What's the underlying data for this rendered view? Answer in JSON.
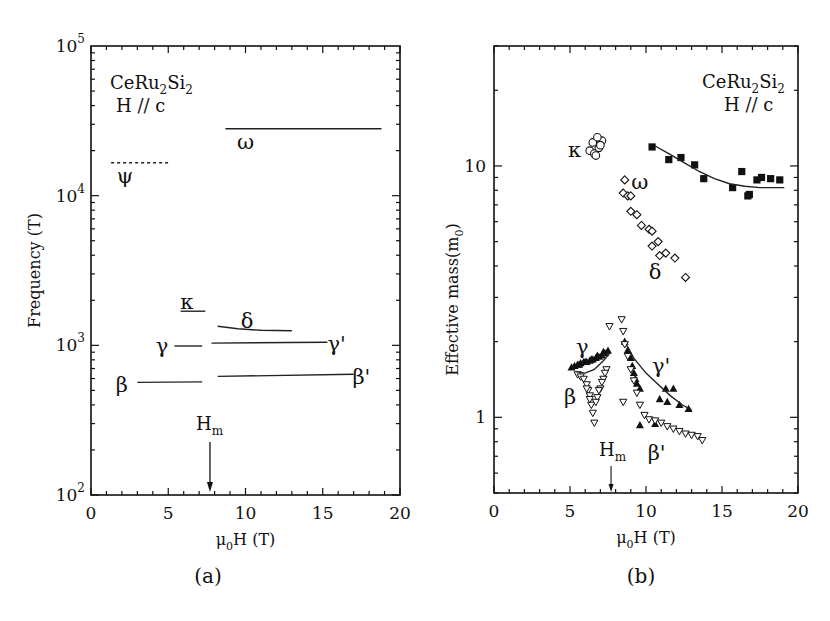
{
  "figure": {
    "panel_labels": [
      "(a)",
      "(b)"
    ]
  },
  "chart_data": [
    {
      "type": "line",
      "panel": "(a)",
      "title": "",
      "annotation": {
        "compound": "CeRu2Si2",
        "compound_parts": [
          "CeRu",
          "2",
          "Si",
          "2"
        ],
        "field_dir": "H // c"
      },
      "xlabel": "μ0H (T)",
      "xlabel_parts": [
        "μ",
        "0",
        "H (T)"
      ],
      "ylabel": "Frequency (T)",
      "xlim": [
        0,
        20
      ],
      "ylim": [
        100,
        100000
      ],
      "yscale": "log",
      "xticks": [
        0,
        5,
        10,
        15,
        20
      ],
      "yticks": [
        {
          "base": "10",
          "exp": "2",
          "value": 100
        },
        {
          "base": "10",
          "exp": "3",
          "value": 1000
        },
        {
          "base": "10",
          "exp": "4",
          "value": 10000
        },
        {
          "base": "10",
          "exp": "5",
          "value": 100000
        }
      ],
      "grid": false,
      "marker_annotation": {
        "label": "H",
        "sub": "m",
        "x": 7.7
      },
      "series": [
        {
          "name": "ω",
          "style": "solid",
          "x": [
            8.7,
            18.8
          ],
          "y": [
            28000,
            28000
          ],
          "label_pos": [
            10.0,
            23000
          ]
        },
        {
          "name": "ψ",
          "style": "dashed",
          "x": [
            1.3,
            5.0
          ],
          "y": [
            16600,
            16600
          ],
          "label_pos": [
            2.2,
            13500
          ]
        },
        {
          "name": "κ",
          "style": "solid",
          "x": [
            5.8,
            7.4
          ],
          "y": [
            1690,
            1690
          ],
          "label_pos": [
            6.2,
            1950
          ]
        },
        {
          "name": "δ",
          "style": "solid",
          "x": [
            8.2,
            9.5,
            11,
            13.0
          ],
          "y": [
            1340,
            1290,
            1260,
            1250
          ],
          "label_pos": [
            10.1,
            1450
          ]
        },
        {
          "name": "γ",
          "style": "solid",
          "x": [
            5.4,
            7.2
          ],
          "y": [
            990,
            990
          ],
          "label_pos": [
            4.6,
            990
          ]
        },
        {
          "name": "γ'",
          "style": "solid",
          "x": [
            7.8,
            15.3
          ],
          "y": [
            1035,
            1050
          ],
          "label_pos": [
            15.9,
            1020
          ]
        },
        {
          "name": "β",
          "style": "solid",
          "x": [
            3.0,
            7.2
          ],
          "y": [
            565,
            570
          ],
          "label_pos": [
            2.0,
            545
          ]
        },
        {
          "name": "β'",
          "style": "solid",
          "x": [
            8.2,
            17.0
          ],
          "y": [
            620,
            640
          ],
          "label_pos": [
            17.5,
            610
          ]
        }
      ]
    },
    {
      "type": "scatter",
      "panel": "(b)",
      "title": "",
      "annotation": {
        "compound": "CeRu2Si2",
        "compound_parts": [
          "CeRu",
          "2",
          "Si",
          "2"
        ],
        "field_dir": "H // c"
      },
      "xlabel": "μ0H (T)",
      "xlabel_parts": [
        "μ",
        "0",
        "H (T)"
      ],
      "ylabel": "Effective mass(m0)",
      "ylabel_parts": [
        "Effective mass(m",
        "0",
        ")"
      ],
      "xlim": [
        0,
        20
      ],
      "ylim": [
        0.5,
        30
      ],
      "yscale": "log",
      "xticks": [
        0,
        5,
        10,
        15,
        20
      ],
      "yticks": [
        {
          "label": "1",
          "value": 1
        },
        {
          "label": "10",
          "value": 10
        }
      ],
      "grid": false,
      "marker_annotation": {
        "label": "H",
        "sub": "m",
        "x": 7.7
      },
      "series": [
        {
          "name": "κ",
          "marker": "open-circle",
          "x": [
            6.3,
            6.6,
            6.9,
            7.1,
            6.5,
            6.8,
            7.0,
            6.7
          ],
          "y": [
            11.5,
            11.2,
            11.8,
            12.6,
            12.4,
            13.0,
            12.1,
            11.0
          ],
          "label_pos": [
            5.3,
            11.6
          ]
        },
        {
          "name": "ω",
          "marker": "filled-square",
          "x": [
            10.4,
            11.5,
            12.3,
            13.2,
            13.8,
            15.7,
            16.3,
            16.7,
            16.8,
            17.3,
            17.6,
            18.2,
            18.8
          ],
          "y": [
            11.9,
            10.6,
            10.8,
            10.1,
            8.9,
            8.2,
            9.5,
            7.6,
            7.7,
            8.8,
            9.0,
            8.9,
            8.8
          ],
          "label_pos": [
            9.6,
            8.6
          ]
        },
        {
          "name": "ω fit",
          "marker": "line",
          "x": [
            10.6,
            11.5,
            12.5,
            13.5,
            14.5,
            15.5,
            16.5,
            17.5,
            18.5,
            19.1
          ],
          "y": [
            12.0,
            11.2,
            10.3,
            9.5,
            8.9,
            8.5,
            8.3,
            8.2,
            8.2,
            8.2
          ]
        },
        {
          "name": "δ",
          "marker": "open-diamond",
          "x": [
            8.6,
            8.5,
            8.8,
            9.0,
            9.0,
            9.4,
            9.7,
            10.2,
            10.4,
            10.8,
            11.3,
            10.4,
            10.9,
            11.9,
            12.6
          ],
          "y": [
            8.8,
            7.8,
            7.6,
            7.6,
            6.6,
            6.4,
            5.8,
            5.6,
            5.5,
            5.0,
            4.5,
            4.8,
            4.4,
            4.3,
            3.6
          ],
          "label_pos": [
            10.6,
            3.8
          ]
        },
        {
          "name": "γ",
          "marker": "filled-triangle-up",
          "x": [
            5.1,
            5.3,
            5.5,
            5.7,
            5.9,
            6.1,
            6.3,
            6.5,
            6.7,
            6.9,
            7.1,
            7.3,
            7.5,
            5.6,
            6.0,
            6.4,
            6.8,
            7.2
          ],
          "y": [
            1.58,
            1.6,
            1.62,
            1.64,
            1.66,
            1.66,
            1.68,
            1.7,
            1.72,
            1.74,
            1.76,
            1.8,
            1.84,
            1.62,
            1.66,
            1.7,
            1.76,
            1.82
          ],
          "label_pos": [
            5.8,
            1.9
          ]
        },
        {
          "name": "β",
          "marker": "open-triangle-down",
          "x": [
            5.5,
            5.7,
            5.9,
            6.1,
            6.2,
            6.3,
            6.4,
            6.5,
            6.6,
            6.8,
            7.0,
            7.2,
            7.4,
            7.6,
            6.7,
            6.9,
            7.1,
            7.3,
            6.1,
            6.3
          ],
          "y": [
            1.48,
            1.45,
            1.42,
            1.35,
            1.28,
            1.22,
            1.12,
            1.04,
            0.95,
            1.2,
            1.3,
            1.42,
            1.55,
            2.3,
            1.15,
            1.28,
            1.38,
            1.5,
            1.3,
            1.18
          ],
          "label_pos": [
            5.0,
            1.2
          ]
        },
        {
          "name": "γ'",
          "marker": "filled-triangle-up",
          "x": [
            8.6,
            8.8,
            9.0,
            9.1,
            9.2,
            9.3,
            9.4,
            9.6,
            11.3,
            11.8,
            10.9,
            11.4,
            12.2,
            12.8,
            9.6,
            10.6
          ],
          "y": [
            2.0,
            1.85,
            1.72,
            1.6,
            1.5,
            1.42,
            1.36,
            1.3,
            1.3,
            1.3,
            1.18,
            1.15,
            1.12,
            1.08,
            0.93,
            0.94
          ],
          "label_pos": [
            11.0,
            1.6
          ]
        },
        {
          "name": "γ' fit",
          "marker": "line",
          "x": [
            8.6,
            9.2,
            10.0,
            10.8,
            11.6,
            12.4,
            13.0
          ],
          "y": [
            2.0,
            1.72,
            1.5,
            1.35,
            1.22,
            1.12,
            1.07
          ]
        },
        {
          "name": "β'",
          "marker": "open-triangle-down",
          "x": [
            8.4,
            8.5,
            8.6,
            8.8,
            9.0,
            9.2,
            9.4,
            9.6,
            9.9,
            10.2,
            10.6,
            11.0,
            11.4,
            11.8,
            12.2,
            12.6,
            13.0,
            13.4,
            13.7,
            8.5
          ],
          "y": [
            2.45,
            2.2,
            1.95,
            1.75,
            1.55,
            1.4,
            1.25,
            1.12,
            1.02,
            0.98,
            0.97,
            0.95,
            0.92,
            0.9,
            0.88,
            0.86,
            0.85,
            0.84,
            0.81,
            1.15
          ],
          "label_pos": [
            10.7,
            0.72
          ]
        },
        {
          "name": "γ-β fit",
          "marker": "line",
          "x": [
            5.4,
            6.0,
            6.6,
            7.2,
            7.6
          ],
          "y": [
            1.52,
            1.5,
            1.55,
            1.68,
            1.8
          ]
        }
      ]
    }
  ]
}
